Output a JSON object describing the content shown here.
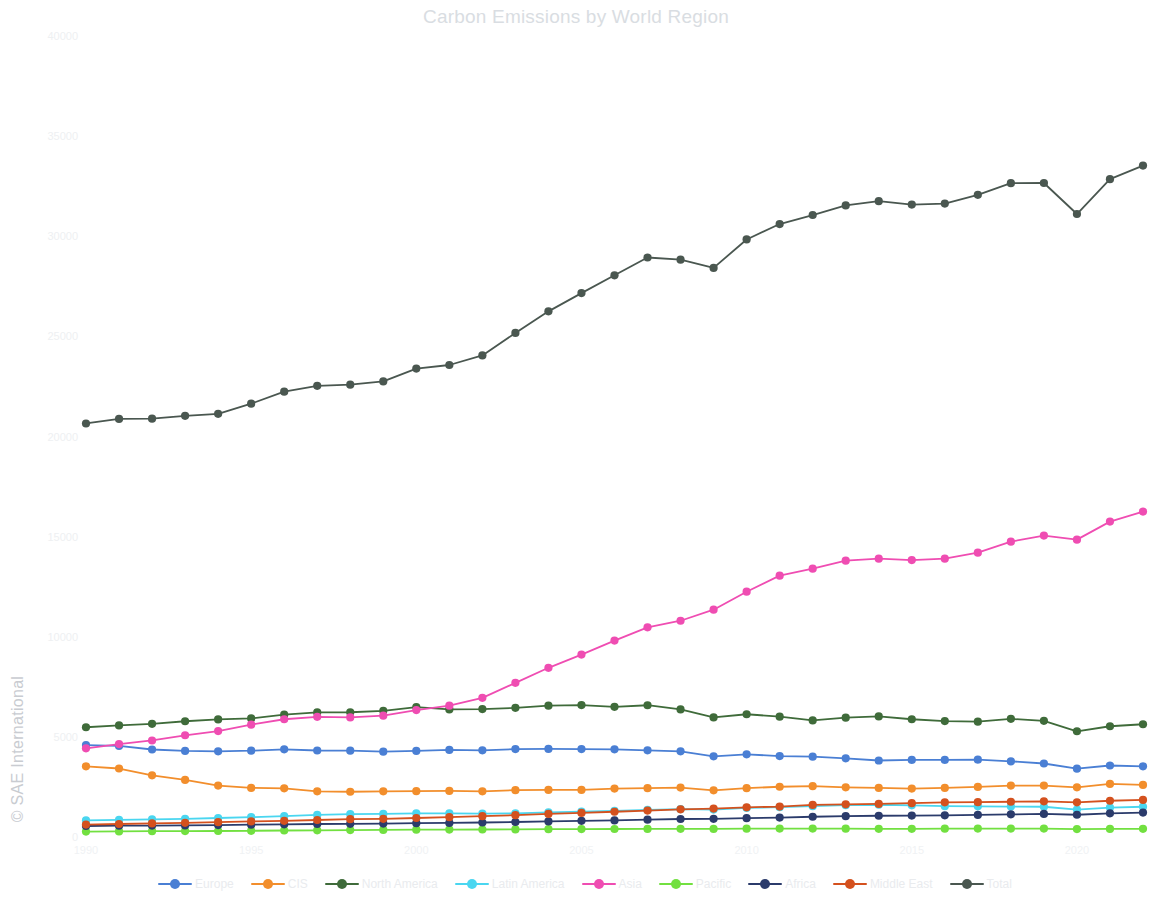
{
  "chart_data": {
    "type": "line",
    "title": "Carbon Emissions by World Region",
    "xlabel": "",
    "ylabel": "",
    "xlim": [
      1990,
      2022
    ],
    "ylim": [
      0,
      40000
    ],
    "grid": false,
    "legend_position": "bottom",
    "x": [
      1990,
      1991,
      1992,
      1993,
      1994,
      1995,
      1996,
      1997,
      1998,
      1999,
      2000,
      2001,
      2002,
      2003,
      2004,
      2005,
      2006,
      2007,
      2008,
      2009,
      2010,
      2011,
      2012,
      2013,
      2014,
      2015,
      2016,
      2017,
      2018,
      2019,
      2020,
      2021,
      2022
    ],
    "xticks": [
      1990,
      1995,
      2000,
      2005,
      2010,
      2015,
      2020
    ],
    "xtick_labels": [
      "1990",
      "1995",
      "2000",
      "2005",
      "2010",
      "2015",
      "2020"
    ],
    "yticks": [
      0,
      5000,
      10000,
      15000,
      20000,
      25000,
      30000,
      35000,
      40000
    ],
    "ytick_labels": [
      "0",
      "5000",
      "10000",
      "15000",
      "20000",
      "25000",
      "30000",
      "35000",
      "40000"
    ],
    "series": [
      {
        "name": "Europe",
        "color": "#4a7fd4",
        "values": [
          4640,
          4600,
          4420,
          4350,
          4330,
          4360,
          4430,
          4370,
          4360,
          4310,
          4350,
          4400,
          4380,
          4440,
          4450,
          4440,
          4430,
          4380,
          4330,
          4080,
          4180,
          4090,
          4060,
          3980,
          3870,
          3900,
          3900,
          3910,
          3830,
          3720,
          3460,
          3620,
          3580
        ]
      },
      {
        "name": "CIS",
        "color": "#f28e2c",
        "values": [
          3580,
          3470,
          3130,
          2900,
          2620,
          2500,
          2480,
          2330,
          2310,
          2330,
          2340,
          2350,
          2330,
          2390,
          2400,
          2400,
          2470,
          2490,
          2520,
          2380,
          2490,
          2560,
          2590,
          2530,
          2500,
          2470,
          2500,
          2550,
          2620,
          2620,
          2530,
          2700,
          2650
        ]
      },
      {
        "name": "North America",
        "color": "#3f6b3a",
        "values": [
          5530,
          5620,
          5700,
          5830,
          5920,
          5970,
          6160,
          6270,
          6280,
          6350,
          6540,
          6420,
          6440,
          6500,
          6610,
          6640,
          6550,
          6630,
          6420,
          6020,
          6180,
          6060,
          5870,
          6010,
          6070,
          5930,
          5840,
          5810,
          5950,
          5850,
          5330,
          5580,
          5680
        ]
      },
      {
        "name": "Latin America",
        "color": "#4ad6f0",
        "values": [
          880,
          910,
          930,
          960,
          1000,
          1040,
          1090,
          1150,
          1190,
          1200,
          1230,
          1230,
          1220,
          1230,
          1280,
          1320,
          1350,
          1400,
          1440,
          1420,
          1500,
          1540,
          1590,
          1640,
          1660,
          1630,
          1590,
          1580,
          1570,
          1560,
          1420,
          1520,
          1560
        ]
      },
      {
        "name": "Asia",
        "color": "#ef4db2",
        "values": [
          4480,
          4690,
          4870,
          5130,
          5340,
          5660,
          5930,
          6050,
          6020,
          6110,
          6390,
          6610,
          7000,
          7750,
          8500,
          9160,
          9860,
          10520,
          10850,
          11400,
          12300,
          13100,
          13450,
          13850,
          13950,
          13880,
          13950,
          14250,
          14800,
          15100,
          14900,
          15800,
          16300
        ]
      },
      {
        "name": "Pacific",
        "color": "#72e040",
        "values": [
          320,
          330,
          340,
          345,
          350,
          360,
          375,
          385,
          395,
          405,
          415,
          420,
          425,
          430,
          440,
          445,
          450,
          455,
          460,
          455,
          465,
          470,
          470,
          465,
          460,
          460,
          465,
          470,
          470,
          470,
          445,
          455,
          460
        ]
      },
      {
        "name": "Africa",
        "color": "#2b3b6b",
        "values": [
          600,
          615,
          620,
          630,
          645,
          665,
          685,
          700,
          710,
          720,
          740,
          755,
          775,
          800,
          830,
          860,
          880,
          915,
          950,
          960,
          990,
          1020,
          1060,
          1090,
          1110,
          1120,
          1130,
          1150,
          1180,
          1200,
          1160,
          1230,
          1270
        ]
      },
      {
        "name": "Middle East",
        "color": "#d4511e",
        "values": [
          670,
          700,
          730,
          760,
          790,
          830,
          860,
          900,
          940,
          960,
          1000,
          1040,
          1090,
          1140,
          1200,
          1250,
          1310,
          1370,
          1430,
          1470,
          1530,
          1570,
          1650,
          1680,
          1700,
          1740,
          1780,
          1790,
          1810,
          1830,
          1780,
          1860,
          1900
        ]
      },
      {
        "name": "Total",
        "color": "#4a5750",
        "values": [
          20700,
          20930,
          20940,
          21080,
          21180,
          21690,
          22290,
          22580,
          22640,
          22800,
          23440,
          23620,
          24100,
          25220,
          26300,
          27210,
          28100,
          28990,
          28880,
          28470,
          29890,
          30660,
          31110,
          31590,
          31800,
          31630,
          31680,
          32120,
          32700,
          32710,
          31160,
          32900,
          33580
        ]
      }
    ]
  },
  "title": "Carbon Emissions by World Region",
  "watermark": "© SAE International",
  "legend": {
    "items": [
      {
        "label": "Europe",
        "color": "#4a7fd4"
      },
      {
        "label": "CIS",
        "color": "#f28e2c"
      },
      {
        "label": "North America",
        "color": "#3f6b3a"
      },
      {
        "label": "Latin America",
        "color": "#4ad6f0"
      },
      {
        "label": "Asia",
        "color": "#ef4db2"
      },
      {
        "label": "Pacific",
        "color": "#72e040"
      },
      {
        "label": "Africa",
        "color": "#2b3b6b"
      },
      {
        "label": "Middle East",
        "color": "#d4511e"
      },
      {
        "label": "Total",
        "color": "#4a5750"
      }
    ]
  }
}
